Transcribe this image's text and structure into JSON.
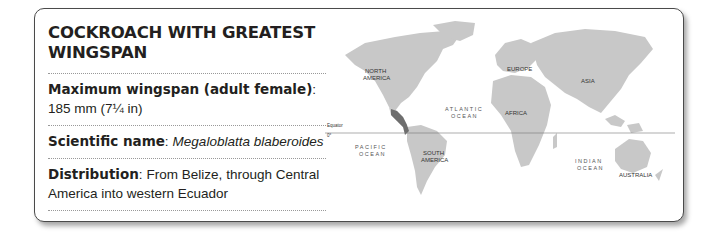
{
  "card": {
    "title": "COCKROACH WITH GREATEST WINGSPAN",
    "rows": [
      {
        "label": "Maximum wingspan (adult female)",
        "sep": ":",
        "value": "185 mm (7¼ in)"
      },
      {
        "label": "Scientific name",
        "sep": ":",
        "value": "Megaloblatta blaberoides"
      },
      {
        "label": "Distribution",
        "sep": ":",
        "value": "From Belize, through Central America into western Ecuador"
      }
    ]
  },
  "map": {
    "continents": [
      "NORTH",
      "AMERICA",
      "SOUTH",
      "AMERICA",
      "EUROPE",
      "AFRICA",
      "ASIA",
      "AUSTRALIA"
    ],
    "oceans": {
      "atlantic": [
        "ATLANTIC",
        "OCEAN"
      ],
      "pacific": [
        "PACIFIC",
        "OCEAN"
      ],
      "indian": [
        "INDIAN",
        "OCEAN"
      ]
    },
    "equator_label": "Equator",
    "equator_degree": "0°",
    "land_color": "#c8c8c8",
    "highlight_color": "#6e6e6e"
  }
}
